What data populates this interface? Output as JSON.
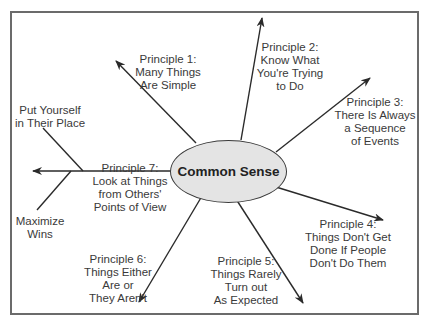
{
  "diagram": {
    "center": {
      "label": "Common Sense",
      "fill": "#e4e4e4"
    },
    "principles": [
      {
        "lines": [
          "Principle 1:",
          "Many Things",
          "Are Simple"
        ]
      },
      {
        "lines": [
          "Principle 2:",
          "Know What",
          "You're Trying",
          "to Do"
        ]
      },
      {
        "lines": [
          "Principle 3:",
          "There Is Always",
          "a Sequence",
          "of Events"
        ]
      },
      {
        "lines": [
          "Principle 4:",
          "Things Don't Get",
          "Done If People",
          "Don't Do Them"
        ]
      },
      {
        "lines": [
          "Principle 5:",
          "Things Rarely",
          "Turn out",
          "As Expected"
        ]
      },
      {
        "lines": [
          "Principle 6:",
          "Things Either",
          "Are or",
          "They Aren't"
        ]
      },
      {
        "lines": [
          "Principle 7:",
          "Look at Things",
          "from Others'",
          "Points of View"
        ]
      }
    ],
    "branches": [
      {
        "lines": [
          "Put Yourself",
          "in Their Place"
        ]
      },
      {
        "lines": [
          "Maximize",
          "Wins"
        ]
      }
    ],
    "colors": {
      "line": "#2a2a2a",
      "frame": "#6b6b6b",
      "text": "#3a3a3a"
    }
  }
}
